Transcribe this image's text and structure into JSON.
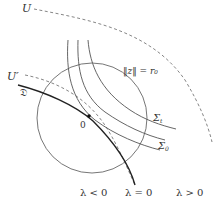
{
  "diagram": {
    "labels": {
      "U": "U",
      "U_prime": "U′",
      "D": "𝔇",
      "origin": "0",
      "norm": "‖z‖ = r₀",
      "sigma_t": "Σ",
      "sigma_t_sub": "t",
      "sigma_0": "Σ",
      "sigma_0_sub": "0",
      "lambda_neg": "λ < 0",
      "lambda_zero": "λ = 0",
      "lambda_pos": "λ > 0"
    },
    "colors": {
      "curve": "#555555",
      "dark_curve": "#222222",
      "dashed": "#777777",
      "text": "#333333"
    }
  }
}
